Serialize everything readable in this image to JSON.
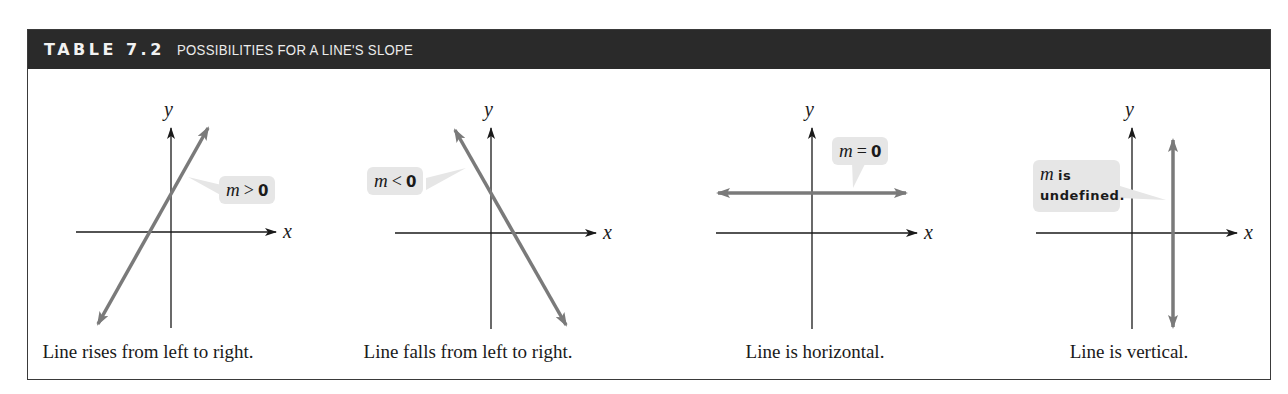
{
  "table": {
    "number": "TABLE 7.2",
    "title": "POSSIBILITIES FOR A LINE'S SLOPE"
  },
  "axes": {
    "x_label": "x",
    "y_label": "y"
  },
  "colors": {
    "header_bg": "#2a2a2a",
    "line": "#7a7a7a",
    "axis": "#1a1a1a",
    "callout_bg": "#e6e6e6",
    "border": "#3a3a3a"
  },
  "panels": [
    {
      "slope_case": "positive",
      "callout": {
        "m": "m",
        "relation": ">",
        "value": "0"
      },
      "caption": "Line rises from left to right."
    },
    {
      "slope_case": "negative",
      "callout": {
        "m": "m",
        "relation": "<",
        "value": "0"
      },
      "caption": "Line falls from left to right."
    },
    {
      "slope_case": "zero",
      "callout": {
        "m": "m",
        "relation": "=",
        "value": "0"
      },
      "caption": "Line is horizontal."
    },
    {
      "slope_case": "undefined",
      "callout": {
        "m": "m",
        "word1": "is",
        "word2": "undefined."
      },
      "caption": "Line is vertical."
    }
  ]
}
